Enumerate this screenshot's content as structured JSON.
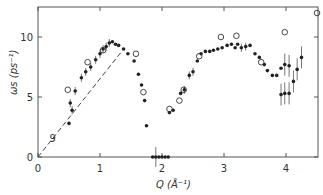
{
  "chart_data": {
    "type": "scatter",
    "title": "",
    "xlabel": "Q (Å⁻¹)",
    "ylabel": "ωs (ps⁻¹)",
    "xlim": [
      0,
      4.5
    ],
    "ylim": [
      0,
      12.5
    ],
    "xticks": [
      "0",
      "1",
      "2",
      "3",
      "4"
    ],
    "yticks": [
      "0",
      "5",
      "10"
    ],
    "grid": false,
    "annotations": [
      {
        "text": "9",
        "x": 0.25,
        "y": 1.6
      }
    ],
    "series": [
      {
        "name": "filled",
        "marker": "filled-circle",
        "points": [
          [
            0.5,
            2.8
          ],
          [
            0.55,
            3.9
          ],
          [
            0.52,
            4.5
          ],
          [
            0.6,
            5.5
          ],
          [
            0.7,
            6.6
          ],
          [
            0.77,
            7.1
          ],
          [
            0.85,
            7.5
          ],
          [
            0.93,
            8.1
          ],
          [
            1.0,
            8.6
          ],
          [
            1.05,
            9.0
          ],
          [
            1.1,
            9.2
          ],
          [
            1.15,
            9.5
          ],
          [
            1.2,
            9.6
          ],
          [
            1.25,
            9.4
          ],
          [
            1.3,
            9.3
          ],
          [
            1.38,
            9.0
          ],
          [
            1.45,
            8.6
          ],
          [
            1.55,
            8.0
          ],
          [
            1.62,
            6.9
          ],
          [
            1.67,
            6.0
          ],
          [
            1.72,
            4.7
          ],
          [
            1.75,
            2.6
          ],
          [
            1.85,
            0.0
          ],
          [
            1.9,
            0.0
          ],
          [
            1.95,
            0.0
          ],
          [
            2.0,
            0.0
          ],
          [
            2.05,
            0.0
          ],
          [
            2.1,
            0.0
          ],
          [
            2.12,
            3.7
          ],
          [
            2.18,
            3.9
          ],
          [
            2.3,
            5.3
          ],
          [
            2.36,
            5.6
          ],
          [
            2.44,
            6.8
          ],
          [
            2.5,
            7.1
          ],
          [
            2.57,
            8.0
          ],
          [
            2.63,
            8.6
          ],
          [
            2.7,
            8.8
          ],
          [
            2.77,
            8.8
          ],
          [
            2.83,
            8.9
          ],
          [
            2.9,
            9.0
          ],
          [
            2.97,
            9.1
          ],
          [
            3.05,
            9.3
          ],
          [
            3.12,
            9.4
          ],
          [
            3.18,
            9.1
          ],
          [
            3.22,
            9.4
          ],
          [
            3.28,
            9.1
          ],
          [
            3.35,
            9.2
          ],
          [
            3.42,
            9.3
          ],
          [
            3.5,
            8.6
          ],
          [
            3.57,
            8.3
          ],
          [
            3.65,
            7.7
          ],
          [
            3.7,
            7.2
          ],
          [
            3.78,
            6.8
          ],
          [
            3.85,
            6.8
          ],
          [
            3.92,
            7.4
          ],
          [
            3.98,
            7.7
          ],
          [
            4.05,
            7.6
          ],
          [
            3.92,
            5.2
          ],
          [
            3.98,
            5.3
          ],
          [
            4.05,
            5.3
          ],
          [
            4.12,
            6.3
          ],
          [
            4.18,
            7.3
          ],
          [
            4.25,
            8.3
          ]
        ]
      },
      {
        "name": "open",
        "marker": "open-circle",
        "points": [
          [
            0.48,
            5.6
          ],
          [
            0.8,
            7.9
          ],
          [
            1.05,
            8.9
          ],
          [
            1.58,
            8.6
          ],
          [
            1.7,
            5.4
          ],
          [
            2.12,
            4.0
          ],
          [
            2.28,
            4.7
          ],
          [
            2.35,
            5.6
          ],
          [
            2.6,
            8.4
          ],
          [
            2.95,
            10.0
          ],
          [
            3.2,
            10.1
          ],
          [
            3.6,
            7.9
          ],
          [
            3.98,
            10.4
          ],
          [
            4.5,
            12.0
          ]
        ]
      }
    ],
    "reference_line": {
      "style": "dashed",
      "from": [
        0,
        0
      ],
      "to": [
        1.35,
        8.8
      ]
    }
  }
}
